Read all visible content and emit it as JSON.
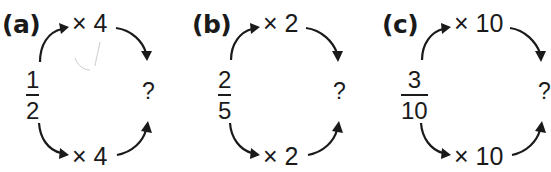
{
  "panels": [
    {
      "label": "(a)",
      "fraction": {
        "numerator": "1",
        "denominator": "2"
      },
      "top_operation": "× 4",
      "bottom_operation": "× 4",
      "result": "?"
    },
    {
      "label": "(b)",
      "fraction": {
        "numerator": "2",
        "denominator": "5"
      },
      "top_operation": "× 2",
      "bottom_operation": "× 2",
      "result": "?"
    },
    {
      "label": "(c)",
      "fraction": {
        "numerator": "3",
        "denominator": "10"
      },
      "top_operation": "× 10",
      "bottom_operation": "× 10",
      "result": "?"
    }
  ],
  "colors": {
    "ink": "#1a1a1a",
    "background": "#ffffff"
  }
}
